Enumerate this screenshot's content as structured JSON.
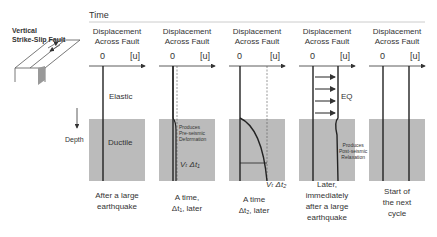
{
  "timeline": {
    "label": "Time"
  },
  "fault": {
    "label_line1": "Vertical",
    "label_line2": "Strike-Slip Fault"
  },
  "depth": {
    "label": "Depth"
  },
  "layers": {
    "elastic": "Elastic",
    "ductile": "Ductile"
  },
  "panel_header": {
    "line1": "Displacement",
    "line2": "Across Fault",
    "zero": "0",
    "unit": "[u]"
  },
  "panels": [
    {
      "caption": [
        "After a large",
        "earthquake"
      ]
    },
    {
      "caption": [
        "A time,",
        "Δt₁, later"
      ],
      "annotation": [
        "Produces",
        "Pre-seismic",
        "Deformation"
      ],
      "velocity": "Vₜ Δt₁"
    },
    {
      "caption": [
        "A time",
        "Δt₂, later"
      ],
      "velocity": "Vₜ Δt₂"
    },
    {
      "caption": [
        "Later,",
        "immediately",
        "after a large",
        "earthquake"
      ],
      "annotation": [
        "Produces",
        "Post-seismic",
        "Relaxation"
      ],
      "eq": "EQ"
    },
    {
      "caption": [
        "Start of",
        "the next",
        "cycle"
      ]
    }
  ]
}
